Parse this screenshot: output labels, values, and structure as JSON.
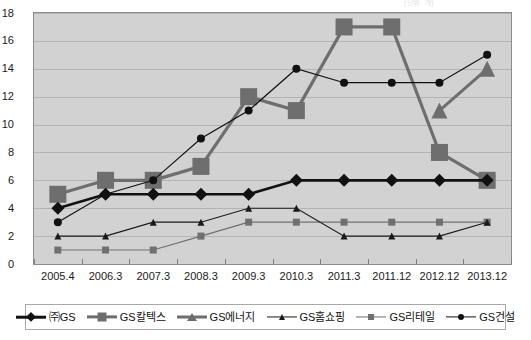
{
  "top_caption": "(단위: 개)",
  "chart_data": {
    "type": "line",
    "title": "",
    "xlabel": "",
    "ylabel": "",
    "ylim": [
      0,
      18
    ],
    "ytick_step": 2,
    "grid": true,
    "legend_position": "bottom",
    "categories": [
      "2005.4",
      "2006.3",
      "2007.3",
      "2008.3",
      "2009.3",
      "2010.3",
      "2011.3",
      "2011.12",
      "2012.12",
      "2013.12"
    ],
    "yticks": [
      "0",
      "2",
      "4",
      "6",
      "8",
      "10",
      "12",
      "14",
      "16",
      "18"
    ],
    "series": [
      {
        "name": "㈜GS",
        "marker": "diamond",
        "color": "#111111",
        "line_width": 2.6,
        "marker_size": 13,
        "values": [
          4,
          5,
          5,
          5,
          5,
          6,
          6,
          6,
          6,
          6
        ]
      },
      {
        "name": "GS칼텍스",
        "marker": "square",
        "color": "#6e6e6e",
        "line_width": 3.2,
        "marker_size": 17,
        "values": [
          5,
          6,
          6,
          7,
          12,
          11,
          17,
          17,
          8,
          6
        ]
      },
      {
        "name": "GS에너지",
        "marker": "triangle",
        "color": "#6e6e6e",
        "line_width": 3.0,
        "marker_size": 16,
        "values": [
          null,
          null,
          null,
          null,
          null,
          null,
          null,
          null,
          11,
          14
        ]
      },
      {
        "name": "GS홈쇼핑",
        "marker": "triangle",
        "color": "#1a1a1a",
        "line_width": 1.1,
        "marker_size": 7,
        "values": [
          2,
          2,
          3,
          3,
          4,
          4,
          2,
          2,
          2,
          3
        ]
      },
      {
        "name": "GS리테일",
        "marker": "square",
        "color": "#707070",
        "line_width": 1.1,
        "marker_size": 7,
        "values": [
          1,
          1,
          1,
          2,
          3,
          3,
          3,
          3,
          3,
          3
        ]
      },
      {
        "name": "GS건설",
        "marker": "circle",
        "color": "#111111",
        "line_width": 1.2,
        "marker_size": 8,
        "values": [
          3,
          5,
          6,
          9,
          11,
          14,
          13,
          13,
          13,
          15
        ]
      }
    ]
  }
}
